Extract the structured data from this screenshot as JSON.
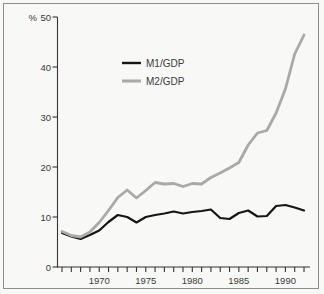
{
  "figure": {
    "background": "#f8f8f6",
    "border_color": "#8d8d8d",
    "axis_color": "#333333",
    "text_color": "#3a3a3a"
  },
  "chart_data": {
    "type": "line",
    "title": "",
    "xlabel": "",
    "ylabel": "%",
    "percent_symbol": "%",
    "grid": false,
    "legend_position": "upper-left-inside",
    "ylim": [
      0,
      50
    ],
    "y_ticks": [
      0,
      10,
      20,
      30,
      40,
      50
    ],
    "x_labeled_ticks": [
      1970,
      1975,
      1980,
      1985,
      1990
    ],
    "x": [
      1966,
      1967,
      1968,
      1969,
      1970,
      1971,
      1972,
      1973,
      1974,
      1975,
      1976,
      1977,
      1978,
      1979,
      1980,
      1981,
      1982,
      1983,
      1984,
      1985,
      1986,
      1987,
      1988,
      1989,
      1990,
      1991,
      1992
    ],
    "series": [
      {
        "name": "M1/GDP",
        "color": "#151515",
        "stroke_width": 2.2,
        "values": [
          6.8,
          6.1,
          5.6,
          6.4,
          7.3,
          9.0,
          10.4,
          10.0,
          8.9,
          10.0,
          10.4,
          10.7,
          11.1,
          10.7,
          11.0,
          11.2,
          11.5,
          9.8,
          9.6,
          10.8,
          11.3,
          10.1,
          10.2,
          12.2,
          12.4,
          11.9,
          11.3
        ]
      },
      {
        "name": "M2/GDP",
        "color": "#a9a9a7",
        "stroke_width": 2.8,
        "values": [
          7.1,
          6.3,
          6.0,
          7.0,
          8.9,
          11.3,
          13.9,
          15.4,
          13.8,
          15.3,
          16.9,
          16.6,
          16.7,
          16.1,
          16.7,
          16.6,
          17.9,
          18.8,
          19.8,
          20.9,
          24.4,
          26.8,
          27.3,
          30.8,
          35.6,
          42.6,
          46.4
        ]
      }
    ]
  }
}
